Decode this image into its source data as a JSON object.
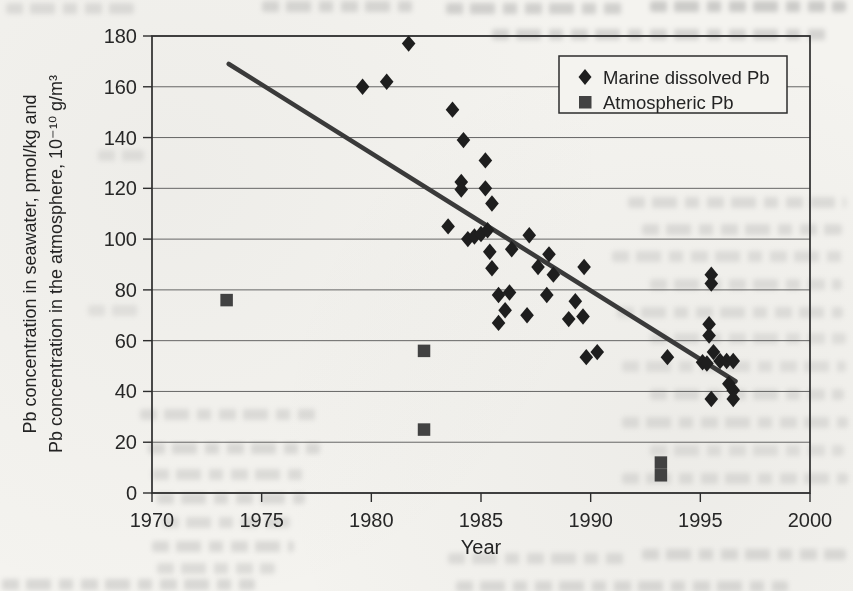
{
  "figure": {
    "paper_color": "#f4f3ef",
    "ink_color": "#2d2d2d"
  },
  "chart_data": {
    "type": "scatter",
    "title": "",
    "xlabel": "Year",
    "ylabel_line1": "Pb concentration in seawater, pmol/kg and",
    "ylabel_line2": "Pb concentration in the atmosphere, 10⁻¹⁰ g/m³",
    "xlim": [
      1970,
      2000
    ],
    "ylim": [
      0,
      180
    ],
    "x_ticks": [
      1970,
      1975,
      1980,
      1985,
      1990,
      1995,
      2000
    ],
    "y_ticks": [
      0,
      20,
      40,
      60,
      80,
      100,
      120,
      140,
      160,
      180
    ],
    "grid": "horizontal",
    "legend": {
      "position": "top-right-inside",
      "entries": [
        {
          "label": "Marine dissolved Pb",
          "marker": "diamond",
          "color": "#1e1e1e"
        },
        {
          "label": "Atmospheric Pb",
          "marker": "square",
          "color": "#424242"
        }
      ]
    },
    "series": [
      {
        "name": "Marine dissolved Pb",
        "marker": "diamond",
        "color": "#1e1e1e",
        "points": [
          [
            1979.6,
            160
          ],
          [
            1980.7,
            162
          ],
          [
            1981.7,
            177
          ],
          [
            1983.5,
            105
          ],
          [
            1983.7,
            151
          ],
          [
            1984.1,
            122.5
          ],
          [
            1984.1,
            119.5
          ],
          [
            1984.2,
            139
          ],
          [
            1984.4,
            100
          ],
          [
            1984.7,
            101
          ],
          [
            1985.0,
            102
          ],
          [
            1985.3,
            103.5
          ],
          [
            1985.2,
            131
          ],
          [
            1985.2,
            120
          ],
          [
            1985.5,
            114
          ],
          [
            1985.4,
            95
          ],
          [
            1985.5,
            88.5
          ],
          [
            1985.8,
            78
          ],
          [
            1985.8,
            67
          ],
          [
            1986.1,
            72
          ],
          [
            1986.3,
            79
          ],
          [
            1986.4,
            96
          ],
          [
            1987.1,
            70
          ],
          [
            1987.2,
            101.5
          ],
          [
            1987.6,
            89
          ],
          [
            1988.0,
            78
          ],
          [
            1988.1,
            94
          ],
          [
            1988.3,
            86
          ],
          [
            1989.0,
            68.5
          ],
          [
            1989.3,
            75.5
          ],
          [
            1989.65,
            69.5
          ],
          [
            1989.7,
            89
          ],
          [
            1989.8,
            53.5
          ],
          [
            1990.3,
            55.5
          ],
          [
            1993.5,
            53.5
          ],
          [
            1995.1,
            51.5
          ],
          [
            1995.3,
            51
          ],
          [
            1995.4,
            66.5
          ],
          [
            1995.4,
            62
          ],
          [
            1995.5,
            86
          ],
          [
            1995.5,
            82.5
          ],
          [
            1995.5,
            37
          ],
          [
            1995.6,
            55.5
          ],
          [
            1995.9,
            52
          ],
          [
            1996.2,
            52
          ],
          [
            1996.5,
            52
          ],
          [
            1996.3,
            43
          ],
          [
            1996.5,
            40.5
          ],
          [
            1996.5,
            37
          ]
        ]
      },
      {
        "name": "Atmospheric Pb",
        "marker": "square",
        "color": "#424242",
        "points": [
          [
            1973.4,
            76
          ],
          [
            1982.4,
            56
          ],
          [
            1982.4,
            25
          ],
          [
            1993.2,
            12
          ],
          [
            1993.2,
            7
          ]
        ]
      }
    ],
    "trend_line": {
      "from": [
        1973.5,
        169
      ],
      "to": [
        1996.6,
        44
      ],
      "color": "#3a3a3a"
    }
  }
}
